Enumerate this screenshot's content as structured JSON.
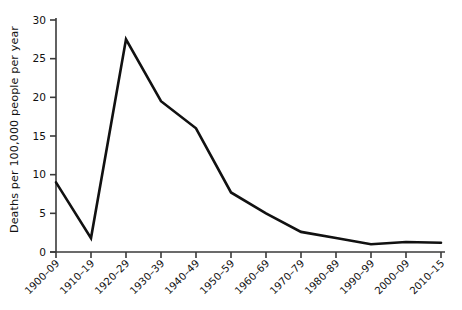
{
  "chart_data": {
    "type": "line",
    "title": "",
    "xlabel": "",
    "ylabel": "Deaths per 100,000 people per year",
    "categories": [
      "1900–09",
      "1910–19",
      "1920–29",
      "1930–39",
      "1940–49",
      "1950–59",
      "1960–69",
      "1970–79",
      "1980–89",
      "1990–99",
      "2000–09",
      "2010–15"
    ],
    "values": [
      9.0,
      1.8,
      27.5,
      19.5,
      16.0,
      7.7,
      5.0,
      2.6,
      1.8,
      1.0,
      1.3,
      1.2
    ],
    "ylim": [
      0,
      30
    ],
    "yticks": [
      0,
      5,
      10,
      15,
      20,
      25,
      30
    ],
    "ytick_labels": [
      "0",
      "5",
      "10",
      "15",
      "20",
      "25",
      "30"
    ],
    "grid": false,
    "legend": "none",
    "line_color": "#111111",
    "axis_color": "#3a3a3a",
    "background": "#ffffff"
  },
  "axis": {
    "y_label": "Deaths per 100,000 people per year"
  }
}
